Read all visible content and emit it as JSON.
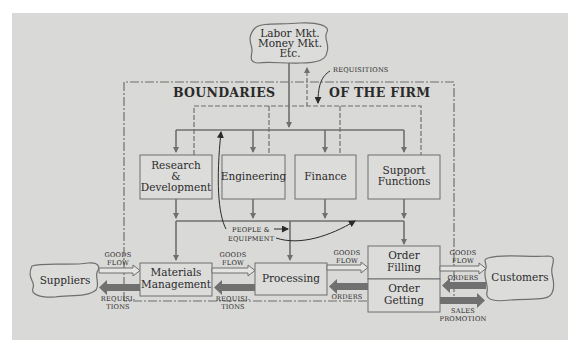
{
  "diagram": {
    "title_left": "BOUNDARIES",
    "title_right": "OF THE FIRM",
    "colors": {
      "background": "#d9d9d7",
      "box_fill": "#dcdcda",
      "line": "#6f6f6f",
      "heavy_arrow": "#707070",
      "text": "#2a2a2a"
    },
    "external": {
      "markets": [
        "Labor Mkt.",
        "Money Mkt.",
        "Etc."
      ],
      "suppliers": "Suppliers",
      "customers": "Customers"
    },
    "functions": {
      "rnd": [
        "Research",
        "&",
        "Development"
      ],
      "engineering": "Engineering",
      "finance": "Finance",
      "support": [
        "Support",
        "Functions"
      ]
    },
    "operations": {
      "materials": [
        "Materials",
        "Management"
      ],
      "processing": "Processing",
      "order_filling": [
        "Order",
        "Filling"
      ],
      "order_getting": [
        "Order",
        "Getting"
      ]
    },
    "flow_labels": {
      "requisitions_top": "REQUISITIONS",
      "people_equipment": [
        "PEOPLE &",
        "EQUIPMENT"
      ],
      "goods_flow": [
        "GOODS",
        "FLOW"
      ],
      "requisitions": [
        "REQUISI-",
        "TIONS"
      ],
      "orders": "ORDERS",
      "sales_promotion": [
        "SALES",
        "PROMOTION"
      ]
    }
  }
}
